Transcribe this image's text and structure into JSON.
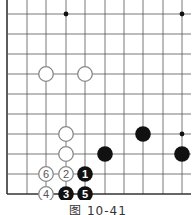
{
  "diagram": {
    "caption": "图 10-41",
    "grid": {
      "columns_x": [
        7,
        27,
        46,
        66,
        85,
        105,
        124,
        143,
        163,
        182
      ],
      "rows_y": [
        14,
        34,
        54,
        74,
        94,
        114,
        134,
        154,
        174,
        194
      ],
      "left_edge": true,
      "bottom_edge": true,
      "line_color": "#555555",
      "edge_color": "#333333"
    },
    "star_points": [
      {
        "col": 3,
        "row": 0
      },
      {
        "col": 9,
        "row": 0
      },
      {
        "col": 9,
        "row": 6
      }
    ],
    "stones": [
      {
        "color": "white",
        "col": 2,
        "row": 3,
        "label": ""
      },
      {
        "color": "white",
        "col": 4,
        "row": 3,
        "label": ""
      },
      {
        "color": "white",
        "col": 3,
        "row": 6,
        "label": ""
      },
      {
        "color": "white",
        "col": 3,
        "row": 7,
        "label": ""
      },
      {
        "color": "black",
        "col": 7,
        "row": 6,
        "label": ""
      },
      {
        "color": "black",
        "col": 5,
        "row": 7,
        "label": ""
      },
      {
        "color": "black",
        "col": 9,
        "row": 7,
        "label": ""
      },
      {
        "color": "black",
        "col": 4,
        "row": 8,
        "label": "1"
      },
      {
        "color": "white",
        "col": 3,
        "row": 8,
        "label": "2"
      },
      {
        "color": "black",
        "col": 3,
        "row": 9,
        "label": "3"
      },
      {
        "color": "white",
        "col": 2,
        "row": 9,
        "label": "4"
      },
      {
        "color": "black",
        "col": 4,
        "row": 9,
        "label": "5"
      },
      {
        "color": "white",
        "col": 2,
        "row": 8,
        "label": "6"
      }
    ],
    "colors": {
      "black_stone": "#111111",
      "white_stone_fill": "#ffffff",
      "white_stone_stroke": "#888888",
      "white_label": "#555555",
      "black_label": "#ffffff"
    }
  }
}
